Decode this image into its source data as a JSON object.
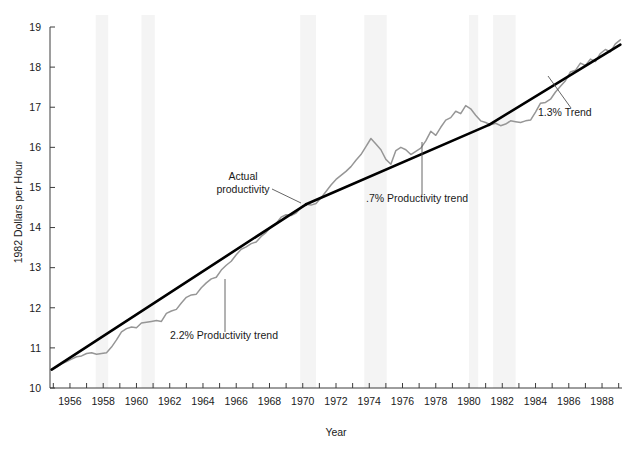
{
  "chart_data": {
    "type": "line",
    "title": "",
    "xlabel": "Year",
    "ylabel": "1982 Dollars per Hour",
    "xlim": [
      1954.8,
      1989.2
    ],
    "ylim": [
      10,
      19
    ],
    "grid": false,
    "legend_position": "none",
    "y_ticks": [
      10,
      11,
      12,
      13,
      14,
      15,
      16,
      17,
      18,
      19
    ],
    "y_tick_labels": [
      "10",
      "11",
      "12",
      "13",
      "14",
      "15",
      "16",
      "17",
      "18",
      "19"
    ],
    "x_ticks": [
      1955,
      1956,
      1957,
      1958,
      1959,
      1960,
      1961,
      1962,
      1963,
      1964,
      1965,
      1966,
      1967,
      1968,
      1969,
      1970,
      1971,
      1972,
      1973,
      1974,
      1975,
      1976,
      1977,
      1978,
      1979,
      1980,
      1981,
      1982,
      1983,
      1984,
      1985,
      1986,
      1987,
      1988,
      1989
    ],
    "x_tick_labels_shown": [
      "1956",
      "1958",
      "1960",
      "1962",
      "1964",
      "1966",
      "1968",
      "1970",
      "1972",
      "1974",
      "1976",
      "1978",
      "1980",
      "1982",
      "1984",
      "1986",
      "1988"
    ],
    "series": [
      {
        "name": "Actual productivity",
        "color": "#969696",
        "x": [
          1954.9,
          1955.2,
          1955.5,
          1955.8,
          1956.1,
          1956.4,
          1956.7,
          1957.0,
          1957.3,
          1957.6,
          1957.9,
          1958.2,
          1958.5,
          1958.8,
          1959.1,
          1959.4,
          1959.7,
          1960.0,
          1960.3,
          1960.6,
          1960.9,
          1961.2,
          1961.5,
          1961.8,
          1962.1,
          1962.4,
          1962.7,
          1963.0,
          1963.3,
          1963.6,
          1963.9,
          1964.2,
          1964.5,
          1964.8,
          1965.1,
          1965.4,
          1965.7,
          1966.0,
          1966.3,
          1966.6,
          1966.9,
          1967.2,
          1967.5,
          1967.8,
          1968.1,
          1968.4,
          1968.7,
          1969.0,
          1969.3,
          1969.6,
          1969.9,
          1970.2,
          1970.5,
          1970.8,
          1971.1,
          1971.4,
          1971.7,
          1972.0,
          1972.3,
          1972.6,
          1972.9,
          1973.2,
          1973.5,
          1973.8,
          1974.1,
          1974.4,
          1974.7,
          1975.0,
          1975.3,
          1975.6,
          1975.9,
          1976.2,
          1976.5,
          1976.8,
          1977.1,
          1977.4,
          1977.7,
          1978.0,
          1978.3,
          1978.6,
          1978.9,
          1979.2,
          1979.5,
          1979.8,
          1980.1,
          1980.4,
          1980.7,
          1981.0,
          1981.3,
          1981.6,
          1981.9,
          1982.2,
          1982.5,
          1982.8,
          1983.1,
          1983.4,
          1983.7,
          1984.0,
          1984.3,
          1984.6,
          1984.9,
          1985.2,
          1985.5,
          1985.8,
          1986.1,
          1986.4,
          1986.7,
          1987.0,
          1987.3,
          1987.6,
          1987.9,
          1988.2,
          1988.5,
          1988.8,
          1989.1
        ],
        "y": [
          10.46,
          10.52,
          10.6,
          10.66,
          10.72,
          10.78,
          10.8,
          10.86,
          10.88,
          10.84,
          10.86,
          10.88,
          11.02,
          11.2,
          11.4,
          11.48,
          11.52,
          11.5,
          11.62,
          11.64,
          11.66,
          11.68,
          11.66,
          11.86,
          11.92,
          11.96,
          12.12,
          12.26,
          12.32,
          12.34,
          12.5,
          12.62,
          12.72,
          12.76,
          12.94,
          13.06,
          13.16,
          13.32,
          13.46,
          13.52,
          13.6,
          13.64,
          13.78,
          13.88,
          14.02,
          14.1,
          14.26,
          14.32,
          14.3,
          14.36,
          14.5,
          14.58,
          14.56,
          14.6,
          14.74,
          14.9,
          15.06,
          15.2,
          15.3,
          15.4,
          15.52,
          15.68,
          15.82,
          16.02,
          16.22,
          16.08,
          15.94,
          15.7,
          15.58,
          15.92,
          16.0,
          15.94,
          15.82,
          15.9,
          15.98,
          16.16,
          16.4,
          16.3,
          16.5,
          16.68,
          16.74,
          16.9,
          16.84,
          17.04,
          16.96,
          16.8,
          16.66,
          16.62,
          16.56,
          16.6,
          16.54,
          16.58,
          16.66,
          16.64,
          16.62,
          16.66,
          16.68,
          16.88,
          17.1,
          17.12,
          17.2,
          17.38,
          17.52,
          17.66,
          17.88,
          17.92,
          18.1,
          18.04,
          18.2,
          18.14,
          18.34,
          18.44,
          18.38,
          18.58,
          18.68
        ]
      },
      {
        "name": "2.2% Productivity trend",
        "color": "#000000",
        "segment": [
          [
            1954.9,
            10.46
          ],
          [
            1970.2,
            14.58
          ]
        ]
      },
      {
        "name": ".7% Productivity trend",
        "color": "#000000",
        "segment": [
          [
            1970.2,
            14.58
          ],
          [
            1981.2,
            16.56
          ]
        ]
      },
      {
        "name": "1.3% Trend",
        "color": "#000000",
        "segment": [
          [
            1981.2,
            16.56
          ],
          [
            1989.1,
            18.56
          ]
        ]
      }
    ],
    "shaded_bands": {
      "color": "#f4f4f4",
      "label": "recession-band",
      "ranges": [
        [
          1957.55,
          1958.3
        ],
        [
          1960.3,
          1961.1
        ],
        [
          1969.85,
          1970.8
        ],
        [
          1973.7,
          1975.05
        ],
        [
          1980.0,
          1980.55
        ],
        [
          1981.45,
          1982.8
        ]
      ]
    },
    "annotations": [
      {
        "name": "actual-productivity",
        "text_line1": "Actual",
        "text_line2": "productivity",
        "tx": 243,
        "ty": 180,
        "anchor": "middle",
        "leader": [
          [
            272,
            189
          ],
          [
            301,
            203
          ]
        ]
      },
      {
        "name": "trend-2-2",
        "text": "2.2% Productivity trend",
        "tx": 170,
        "ty": 339,
        "anchor": "start",
        "leader": [
          [
            225,
            332
          ],
          [
            225,
            279
          ]
        ]
      },
      {
        "name": "trend-0-7",
        "text": ".7% Productivity trend",
        "tx": 366,
        "ty": 202,
        "anchor": "start",
        "leader": [
          [
            422,
            195
          ],
          [
            422,
            142
          ]
        ]
      },
      {
        "name": "trend-1-3",
        "text": "1.3% Trend",
        "tx": 538,
        "ty": 116,
        "anchor": "start",
        "leader": [
          [
            571,
            108
          ],
          [
            548,
            76
          ]
        ]
      }
    ]
  },
  "axes": {
    "x_label": "Year",
    "y_label": "1982 Dollars per Hour",
    "axis_color": "#3c3c3c"
  }
}
